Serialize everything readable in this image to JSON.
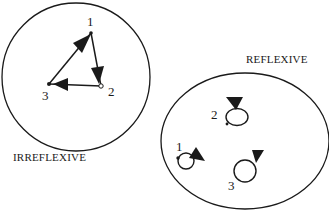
{
  "diagram": {
    "left_set": {
      "title": "IRREFLEXIVE",
      "nodes": [
        {
          "id": "1",
          "label": "1"
        },
        {
          "id": "2",
          "label": "2"
        },
        {
          "id": "3",
          "label": "3"
        }
      ],
      "edges": [
        {
          "from": "1",
          "to": "2"
        },
        {
          "from": "2",
          "to": "3"
        },
        {
          "from": "3",
          "to": "1"
        }
      ]
    },
    "right_set": {
      "title": "REFLEXIVE",
      "nodes": [
        {
          "id": "1",
          "label": "1"
        },
        {
          "id": "2",
          "label": "2"
        },
        {
          "id": "3",
          "label": "3"
        }
      ],
      "edges": [
        {
          "from": "1",
          "to": "1"
        },
        {
          "from": "2",
          "to": "2"
        },
        {
          "from": "3",
          "to": "3"
        }
      ]
    },
    "colors": {
      "stroke": "#1a1a1a",
      "background": "#ffffff"
    }
  }
}
